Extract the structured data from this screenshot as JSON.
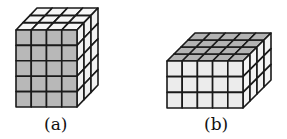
{
  "figures": [
    {
      "label": "(a)",
      "front": {
        "cols": 4,
        "rows": 5,
        "fill": "#b8b8b8",
        "x": 16,
        "y": 30,
        "w": 61,
        "h": 77
      },
      "depth": 3,
      "dx": 21,
      "dy": -22,
      "top_fill": "#f6f6f6",
      "side_fill": "#f2f2f2",
      "label_x": 44,
      "label_y": 114
    },
    {
      "label": "(b)",
      "front": {
        "cols": 5,
        "rows": 3,
        "fill": "#ececec",
        "x": 167,
        "y": 61,
        "w": 76,
        "h": 47
      },
      "depth": 4,
      "dx": 28,
      "dy": -28,
      "top_fill": "#b3b3b3",
      "side_fill": "#f4f4f4",
      "label_x": 204,
      "label_y": 114
    }
  ]
}
